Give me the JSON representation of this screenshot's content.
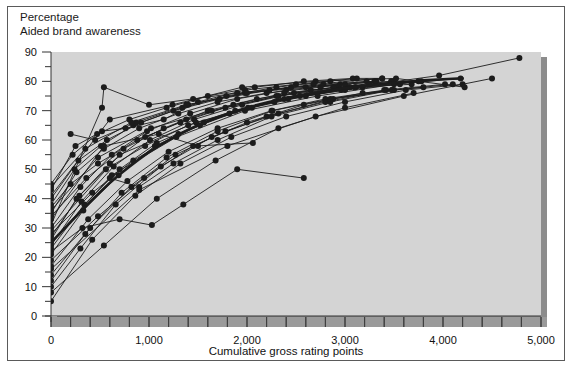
{
  "figure": {
    "title_lines": [
      "Percentage",
      "Aided brand awareness"
    ],
    "background_color": "#ffffff",
    "frame_color": "#5a5a5a"
  },
  "chart_data": {
    "type": "line",
    "title": "Aided brand awareness",
    "subtitle": "Percentage",
    "xlabel": "Cumulative gross rating points",
    "ylabel": "",
    "xlim": [
      0,
      5000
    ],
    "ylim": [
      0,
      90
    ],
    "xticks": [
      0,
      1000,
      2000,
      3000,
      4000,
      5000
    ],
    "xtick_labels": [
      "0",
      "1,000",
      "2,000",
      "3,000",
      "4,000",
      "5,000"
    ],
    "xminor_step": 200,
    "yticks": [
      0,
      10,
      20,
      30,
      40,
      50,
      60,
      70,
      80,
      90
    ],
    "ytick_labels": [
      "0",
      "10",
      "20",
      "30",
      "40",
      "50",
      "60",
      "70",
      "80",
      "90"
    ],
    "yminor_step": 5,
    "grid": false,
    "legend": "none",
    "plot_bg_color": "#d4d4d4",
    "line_color": "#1c1c1c",
    "marker": "circle",
    "marker_size": 3,
    "average_curve": {
      "name": "Average response curve",
      "emphasis": "bold",
      "line_width": 2.6,
      "points": [
        [
          0,
          25
        ],
        [
          200,
          32
        ],
        [
          400,
          39
        ],
        [
          600,
          45.5
        ],
        [
          800,
          51
        ],
        [
          1000,
          56
        ],
        [
          1200,
          60
        ],
        [
          1400,
          63.5
        ],
        [
          1600,
          66.5
        ],
        [
          1800,
          69
        ],
        [
          2000,
          71
        ],
        [
          2200,
          72.8
        ],
        [
          2400,
          74.3
        ],
        [
          2600,
          75.6
        ],
        [
          2800,
          76.7
        ],
        [
          3000,
          77.7
        ],
        [
          3200,
          78.5
        ],
        [
          3400,
          79.2
        ],
        [
          3600,
          79.8
        ],
        [
          3800,
          80.3
        ],
        [
          4000,
          80.7
        ],
        [
          4200,
          81
        ]
      ]
    },
    "series": [
      {
        "name": "brand-01",
        "points": [
          [
            0,
            43
          ],
          [
            250,
            58
          ],
          [
            520,
            63
          ],
          [
            760,
            64
          ],
          [
            1150,
            67
          ],
          [
            1500,
            73
          ],
          [
            1980,
            77
          ],
          [
            2500,
            79
          ],
          [
            3120,
            81
          ],
          [
            3380,
            81
          ]
        ]
      },
      {
        "name": "brand-02",
        "points": [
          [
            0,
            35
          ],
          [
            260,
            49
          ],
          [
            540,
            57
          ],
          [
            900,
            64
          ],
          [
            1300,
            69
          ],
          [
            1700,
            73
          ],
          [
            2200,
            76
          ],
          [
            2750,
            78
          ],
          [
            3300,
            80
          ]
        ]
      },
      {
        "name": "brand-03",
        "points": [
          [
            0,
            30
          ],
          [
            300,
            44
          ],
          [
            620,
            55
          ],
          [
            980,
            63
          ],
          [
            1420,
            69
          ],
          [
            1900,
            74
          ],
          [
            2400,
            77
          ],
          [
            2950,
            79
          ],
          [
            3500,
            80
          ]
        ]
      },
      {
        "name": "brand-04",
        "points": [
          [
            0,
            23
          ],
          [
            340,
            38
          ],
          [
            700,
            50
          ],
          [
            1080,
            59
          ],
          [
            1560,
            66
          ],
          [
            2050,
            71
          ],
          [
            2600,
            75
          ],
          [
            3180,
            78
          ],
          [
            3750,
            80
          ]
        ]
      },
      {
        "name": "brand-05",
        "points": [
          [
            0,
            17
          ],
          [
            380,
            33
          ],
          [
            780,
            46
          ],
          [
            1200,
            56
          ],
          [
            1700,
            64
          ],
          [
            2250,
            70
          ],
          [
            2800,
            74
          ],
          [
            3400,
            77
          ],
          [
            4020,
            79
          ]
        ]
      },
      {
        "name": "brand-06",
        "points": [
          [
            0,
            5
          ],
          [
            420,
            26
          ],
          [
            860,
            41
          ],
          [
            1320,
            52
          ],
          [
            1840,
            61
          ],
          [
            2400,
            68
          ],
          [
            3000,
            73
          ],
          [
            3620,
            77
          ],
          [
            4200,
            79
          ]
        ]
      },
      {
        "name": "brand-07",
        "points": [
          [
            0,
            45
          ],
          [
            220,
            55
          ],
          [
            470,
            62
          ],
          [
            800,
            67
          ],
          [
            1180,
            71
          ],
          [
            1600,
            75
          ],
          [
            2080,
            78
          ],
          [
            2580,
            80
          ],
          [
            3080,
            81
          ]
        ]
      },
      {
        "name": "brand-08",
        "points": [
          [
            0,
            38
          ],
          [
            240,
            50
          ],
          [
            510,
            58
          ],
          [
            840,
            65
          ],
          [
            1250,
            70
          ],
          [
            1720,
            74
          ],
          [
            2230,
            77
          ],
          [
            2780,
            79
          ],
          [
            3320,
            80
          ]
        ]
      },
      {
        "name": "brand-09",
        "points": [
          [
            0,
            27
          ],
          [
            290,
            41
          ],
          [
            600,
            52
          ],
          [
            960,
            61
          ],
          [
            1380,
            67
          ],
          [
            1860,
            72
          ],
          [
            2380,
            76
          ],
          [
            2920,
            78
          ],
          [
            3470,
            80
          ]
        ]
      },
      {
        "name": "brand-10",
        "points": [
          [
            0,
            21
          ],
          [
            330,
            36
          ],
          [
            690,
            48
          ],
          [
            1060,
            58
          ],
          [
            1520,
            65
          ],
          [
            2010,
            71
          ],
          [
            2540,
            75
          ],
          [
            3110,
            78
          ],
          [
            3680,
            79
          ]
        ]
      },
      {
        "name": "brand-11",
        "points": [
          [
            0,
            14
          ],
          [
            400,
            30
          ],
          [
            820,
            44
          ],
          [
            1270,
            55
          ],
          [
            1780,
            63
          ],
          [
            2320,
            69
          ],
          [
            2880,
            74
          ],
          [
            3500,
            77
          ],
          [
            4100,
            79
          ]
        ]
      },
      {
        "name": "brand-12",
        "points": [
          [
            0,
            31
          ],
          [
            520,
            71
          ],
          [
            540,
            78
          ],
          [
            1000,
            72
          ],
          [
            1450,
            74
          ],
          [
            1900,
            76
          ],
          [
            2450,
            78
          ],
          [
            3000,
            79
          ]
        ]
      },
      {
        "name": "brand-13",
        "points": [
          [
            0,
            40
          ],
          [
            280,
            53
          ],
          [
            570,
            60
          ],
          [
            920,
            66
          ],
          [
            1340,
            71
          ],
          [
            1790,
            75
          ],
          [
            2300,
            78
          ],
          [
            2850,
            80
          ]
        ]
      },
      {
        "name": "brand-14",
        "points": [
          [
            0,
            24
          ],
          [
            310,
            39
          ],
          [
            640,
            51
          ],
          [
            1010,
            60
          ],
          [
            1460,
            67
          ],
          [
            1950,
            72
          ],
          [
            2480,
            76
          ],
          [
            3040,
            78
          ]
        ]
      },
      {
        "name": "brand-15",
        "points": [
          [
            200,
            62
          ],
          [
            450,
            60
          ],
          [
            870,
            66
          ],
          [
            1400,
            72
          ],
          [
            1980,
            76
          ],
          [
            2600,
            78
          ],
          [
            3220,
            80
          ]
        ]
      },
      {
        "name": "brand-16",
        "points": [
          [
            0,
            10
          ],
          [
            300,
            23
          ],
          [
            660,
            38
          ],
          [
            1120,
            51
          ],
          [
            1640,
            61
          ],
          [
            2200,
            68
          ],
          [
            2800,
            73
          ],
          [
            3420,
            77
          ]
        ]
      },
      {
        "name": "brand-17",
        "points": [
          [
            0,
            34
          ],
          [
            360,
            47
          ],
          [
            740,
            57
          ],
          [
            1150,
            64
          ],
          [
            1600,
            70
          ],
          [
            2100,
            74
          ],
          [
            2650,
            77
          ],
          [
            3250,
            79
          ]
        ]
      },
      {
        "name": "brand-18",
        "points": [
          [
            0,
            28
          ],
          [
            420,
            42
          ],
          [
            840,
            53
          ],
          [
            1300,
            62
          ],
          [
            1820,
            69
          ],
          [
            2380,
            74
          ],
          [
            2960,
            77
          ],
          [
            3560,
            79
          ]
        ]
      },
      {
        "name": "brand-19",
        "points": [
          [
            0,
            19
          ],
          [
            480,
            34
          ],
          [
            950,
            47
          ],
          [
            1450,
            58
          ],
          [
            2000,
            66
          ],
          [
            2580,
            72
          ],
          [
            3180,
            76
          ],
          [
            3800,
            78
          ]
        ]
      },
      {
        "name": "brand-20",
        "points": [
          [
            600,
            47
          ],
          [
            900,
            44
          ],
          [
            1250,
            52
          ],
          [
            1700,
            60
          ],
          [
            2250,
            68
          ],
          [
            2850,
            73
          ],
          [
            3480,
            77
          ]
        ]
      },
      {
        "name": "brand-21",
        "points": [
          [
            0,
            37
          ],
          [
            200,
            45
          ],
          [
            480,
            52
          ],
          [
            880,
            60
          ],
          [
            1320,
            66
          ],
          [
            1780,
            71
          ],
          [
            2300,
            75
          ],
          [
            2880,
            78
          ]
        ]
      },
      {
        "name": "brand-22",
        "points": [
          [
            0,
            12
          ],
          [
            350,
            28
          ],
          [
            720,
            42
          ],
          [
            1180,
            54
          ],
          [
            1700,
            63
          ],
          [
            2260,
            70
          ],
          [
            2850,
            74
          ],
          [
            3480,
            77
          ]
        ]
      },
      {
        "name": "brand-23",
        "points": [
          [
            0,
            26
          ],
          [
            260,
            40
          ],
          [
            560,
            50
          ],
          [
            960,
            58
          ],
          [
            1400,
            65
          ],
          [
            1880,
            70
          ],
          [
            2420,
            74
          ],
          [
            3000,
            77
          ]
        ]
      },
      {
        "name": "brand-24",
        "points": [
          [
            0,
            33
          ],
          [
            540,
            58
          ],
          [
            1100,
            62
          ],
          [
            1500,
            58
          ],
          [
            2060,
            59
          ]
        ]
      },
      {
        "name": "brand-25",
        "points": [
          [
            0,
            22
          ],
          [
            320,
            30
          ],
          [
            700,
            33
          ],
          [
            1030,
            31
          ],
          [
            1350,
            38
          ],
          [
            1900,
            50
          ],
          [
            2580,
            47
          ]
        ]
      },
      {
        "name": "brand-26",
        "points": [
          [
            0,
            41
          ],
          [
            600,
            67
          ],
          [
            1240,
            72
          ],
          [
            1950,
            78
          ],
          [
            2700,
            80
          ],
          [
            3520,
            81
          ],
          [
            4220,
            78
          ]
        ]
      },
      {
        "name": "brand-27",
        "points": [
          [
            0,
            29
          ],
          [
            700,
            55
          ],
          [
            1480,
            66
          ],
          [
            2280,
            73
          ],
          [
            3100,
            78
          ],
          [
            3960,
            82
          ],
          [
            4780,
            88
          ]
        ]
      },
      {
        "name": "brand-28",
        "points": [
          [
            0,
            16
          ],
          [
            900,
            43
          ],
          [
            1800,
            58
          ],
          [
            2700,
            68
          ],
          [
            3600,
            75
          ],
          [
            4500,
            81
          ]
        ]
      },
      {
        "name": "brand-29",
        "points": [
          [
            0,
            36
          ],
          [
            480,
            54
          ],
          [
            1020,
            64
          ],
          [
            1640,
            70
          ],
          [
            2320,
            75
          ],
          [
            3050,
            78
          ],
          [
            3780,
            80
          ]
        ]
      },
      {
        "name": "brand-30",
        "points": [
          [
            0,
            44
          ],
          [
            350,
            57
          ],
          [
            820,
            66
          ],
          [
            1380,
            72
          ],
          [
            2000,
            76
          ],
          [
            2680,
            79
          ],
          [
            3380,
            81
          ]
        ]
      },
      {
        "name": "brand-31",
        "points": [
          [
            0,
            8
          ],
          [
            540,
            24
          ],
          [
            1080,
            40
          ],
          [
            1680,
            53
          ],
          [
            2320,
            64
          ],
          [
            3000,
            71
          ],
          [
            3700,
            76
          ]
        ]
      },
      {
        "name": "brand-32",
        "points": [
          [
            0,
            25
          ],
          [
            620,
            48
          ],
          [
            1280,
            61
          ],
          [
            1980,
            70
          ],
          [
            2720,
            75
          ],
          [
            3500,
            79
          ],
          [
            4180,
            81
          ]
        ]
      }
    ]
  },
  "axes": {
    "x_axis_title": "Cumulative gross rating points",
    "y_axis_unit_note": "Percentage"
  }
}
